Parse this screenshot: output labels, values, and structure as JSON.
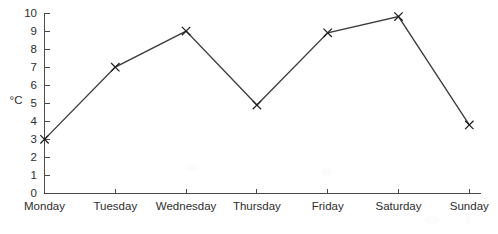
{
  "chart_data": {
    "type": "line",
    "title": "",
    "xlabel": "",
    "ylabel": "°C",
    "categories": [
      "Monday",
      "Tuesday",
      "Wednesday",
      "Thursday",
      "Friday",
      "Saturday",
      "Sunday"
    ],
    "values": [
      3.0,
      7.0,
      9.0,
      4.9,
      8.9,
      9.8,
      3.8
    ],
    "series": [
      {
        "name": "Temperature",
        "values": [
          3.0,
          7.0,
          9.0,
          4.9,
          8.9,
          9.8,
          3.8
        ]
      }
    ],
    "ylim": [
      0,
      10
    ],
    "ytick_labels": [
      "0",
      "1",
      "2",
      "3",
      "4",
      "5",
      "6",
      "7",
      "8",
      "9",
      "10"
    ],
    "ytick_values": [
      0,
      1,
      2,
      3,
      4,
      5,
      6,
      7,
      8,
      9,
      10
    ],
    "grid": false,
    "legend": false,
    "legend_position": "none",
    "marker": "x",
    "line_color": "#3c3c3c",
    "marker_color": "#1f1f1f",
    "axis_color": "#4a4a4a",
    "background_color": "#ffffff"
  }
}
